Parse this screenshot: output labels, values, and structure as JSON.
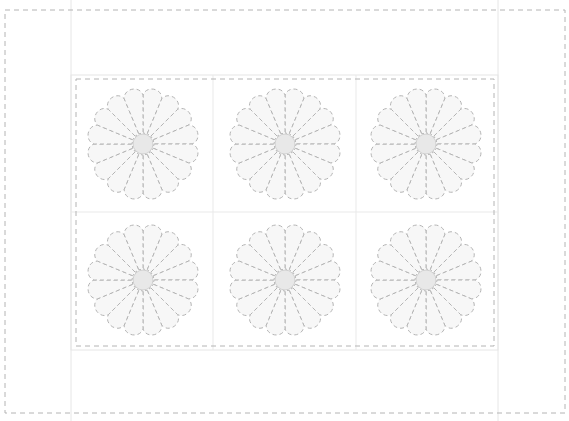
{
  "diagram": {
    "type": "quilt-pattern",
    "canvas": {
      "width": 569,
      "height": 421
    },
    "colors": {
      "background": "#ffffff",
      "panel_line": "#e6e6e6",
      "grid_line": "#e9e9e9",
      "dash_stroke": "#b4b4b4",
      "petal_fill": "#f7f7f7",
      "center_fill": "#e8e8e8",
      "center_stroke": "#cfcfcf"
    },
    "outer_border": {
      "x": 5,
      "y": 10,
      "w": 560,
      "h": 403
    },
    "side_panels": {
      "left_x": 71,
      "right_x": 498
    },
    "inner_block": {
      "solid": {
        "x": 71,
        "y": 75,
        "w": 427,
        "h": 275
      },
      "dashed": {
        "x": 76,
        "y": 79,
        "w": 418,
        "h": 267
      }
    },
    "grid": {
      "cols": 3,
      "rows": 2,
      "col_lines": [
        213,
        356
      ],
      "row_lines": [
        212
      ]
    },
    "blocks": [
      {
        "label": "flower-block-1",
        "cx": 143,
        "cy": 144
      },
      {
        "label": "flower-block-2",
        "cx": 285,
        "cy": 144
      },
      {
        "label": "flower-block-3",
        "cx": 426,
        "cy": 144
      },
      {
        "label": "flower-block-4",
        "cx": 143,
        "cy": 280
      },
      {
        "label": "flower-block-5",
        "cx": 285,
        "cy": 280
      },
      {
        "label": "flower-block-6",
        "cx": 426,
        "cy": 280
      }
    ],
    "flower": {
      "petals": 16,
      "outer_radius": 55,
      "inner_radius": 11,
      "center_radius": 10
    }
  }
}
